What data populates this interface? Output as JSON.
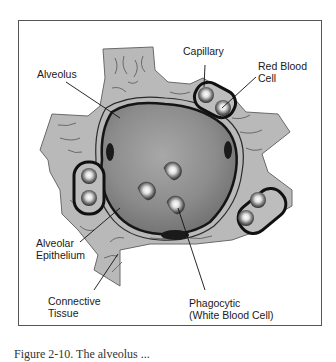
{
  "diagram": {
    "labels": {
      "capillary": "Capillary",
      "red_blood_cell_line1": "Red Blood",
      "red_blood_cell_line2": "Cell",
      "alveolus": "Alveolus",
      "alveolar_epithelium_line1": "Alveolar",
      "alveolar_epithelium_line2": "Epithelium",
      "connective_tissue_line1": "Connective",
      "connective_tissue_line2": "Tissue",
      "phagocytic_line1": "Phagocytic",
      "phagocytic_line2": "(White Blood Cell)"
    },
    "colors": {
      "connective_tissue": "#b8b8b8",
      "alveolus_lumen": "#9a9a9a",
      "epithelium_outline": "#1a1a1a",
      "capillary_outline": "#111111",
      "background": "#ffffff"
    }
  },
  "caption": {
    "text": "Figure 2-10.  The alveolus ..."
  }
}
